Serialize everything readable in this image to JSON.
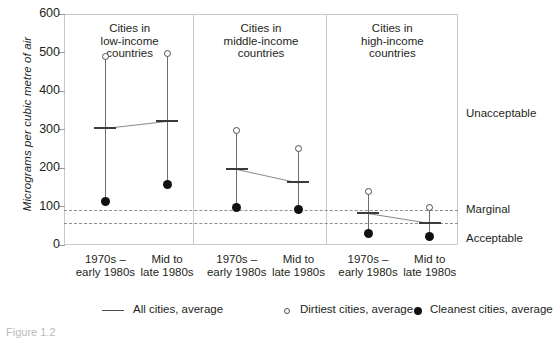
{
  "chart_data": {
    "type": "scatter",
    "title": "",
    "xlabel": "",
    "ylabel": "Micrograms per cubic metre of air",
    "ylim": [
      0,
      600
    ],
    "yticks": [
      0,
      100,
      200,
      300,
      400,
      500,
      600
    ],
    "grid": false,
    "legend_position": "bottom",
    "panels": [
      {
        "heading": [
          "Cities in",
          "low-income",
          "countries"
        ],
        "points": [
          {
            "x_label": [
              "1970s –",
              "early 1980s"
            ],
            "dirtiest": 490,
            "all_cities": 305,
            "cleanest": 112
          },
          {
            "x_label": [
              "Mid to",
              "late 1980s"
            ],
            "dirtiest": 498,
            "all_cities": 323,
            "cleanest": 157
          }
        ]
      },
      {
        "heading": [
          "Cities in",
          "middle-income",
          "countries"
        ],
        "points": [
          {
            "x_label": [
              "1970s –",
              "early 1980s"
            ],
            "dirtiest": 297,
            "all_cities": 198,
            "cleanest": 97
          },
          {
            "x_label": [
              "Mid to",
              "late 1980s"
            ],
            "dirtiest": 250,
            "all_cities": 163,
            "cleanest": 93
          }
        ]
      },
      {
        "heading": [
          "Cities in",
          "high-income",
          "countries"
        ],
        "points": [
          {
            "x_label": [
              "1970s –",
              "early 1980s"
            ],
            "dirtiest": 140,
            "all_cities": 83,
            "cleanest": 31
          },
          {
            "x_label": [
              "Mid to",
              "late 1980s"
            ],
            "dirtiest": 98,
            "all_cities": 57,
            "cleanest": 21
          }
        ]
      }
    ],
    "thresholds": [
      {
        "label": "Marginal",
        "value": 90
      },
      {
        "label": "Acceptable",
        "value": 57
      }
    ],
    "zone_labels": [
      {
        "label": "Unacceptable",
        "value": 340
      }
    ],
    "legend": [
      {
        "marker": "line",
        "label": "All cities, average"
      },
      {
        "marker": "open-circle",
        "label": "Dirtiest cities, average"
      },
      {
        "marker": "filled-circle",
        "label": "Cleanest cities, average"
      }
    ],
    "colors": {
      "frame": "#c9c9c9",
      "whisker": "#6d6d6d",
      "mean_bar": "#3b3b3b",
      "trend_line": "#8a8a8a",
      "dirtiest_marker": "#ffffff",
      "cleanest_marker": "#111111",
      "threshold_line": "#8f8f8f",
      "text": "#231f20"
    }
  },
  "caption": "Figure 1.2"
}
